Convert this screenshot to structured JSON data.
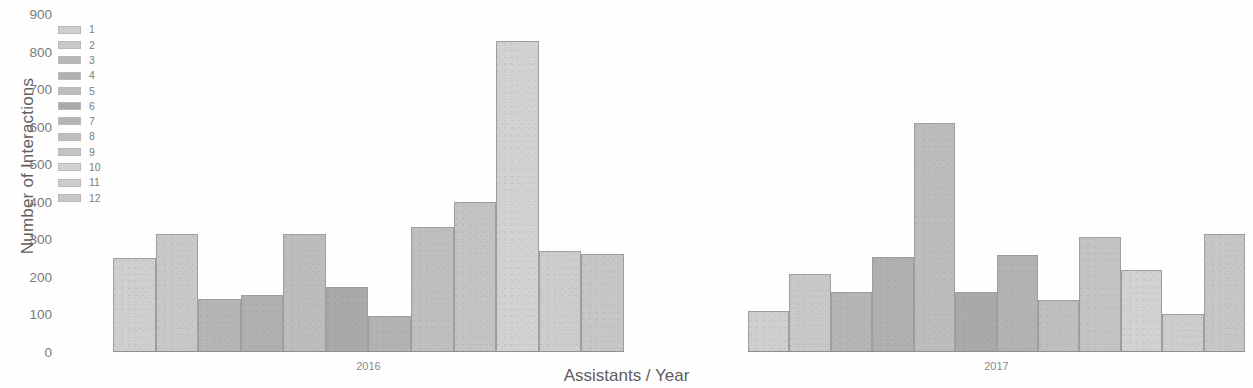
{
  "chart_data": {
    "type": "bar",
    "title": "",
    "xlabel": "Assistants / Year",
    "ylabel": "Number of Interactions",
    "ylim": [
      0,
      900
    ],
    "ytick_labels": [
      "900",
      "800",
      "700",
      "600",
      "500",
      "400",
      "300",
      "200",
      "100",
      "0"
    ],
    "ytick_values": [
      900,
      800,
      700,
      600,
      500,
      400,
      300,
      200,
      100,
      0
    ],
    "grid": false,
    "legend_position": "upper-left",
    "legend_title": "",
    "categories": [
      "2016",
      "2017"
    ],
    "series": [
      {
        "name": "1",
        "color": "#cfcfcf",
        "values": [
          250,
          110
        ]
      },
      {
        "name": "2",
        "color": "#c9c9c9",
        "values": [
          315,
          207
        ]
      },
      {
        "name": "3",
        "color": "#b6b6b6",
        "values": [
          140,
          160
        ]
      },
      {
        "name": "4",
        "color": "#b0b0b0",
        "values": [
          152,
          253
        ]
      },
      {
        "name": "5",
        "color": "#bdbdbd",
        "values": [
          315,
          610
        ]
      },
      {
        "name": "6",
        "color": "#aaaaaa",
        "values": [
          172,
          160
        ]
      },
      {
        "name": "7",
        "color": "#b3b3b3",
        "values": [
          95,
          258
        ]
      },
      {
        "name": "8",
        "color": "#bfbfbf",
        "values": [
          333,
          138
        ]
      },
      {
        "name": "9",
        "color": "#c4c4c4",
        "values": [
          400,
          305
        ]
      },
      {
        "name": "10",
        "color": "#d2d2d2",
        "values": [
          828,
          218
        ]
      },
      {
        "name": "11",
        "color": "#cdcdcd",
        "values": [
          270,
          101
        ]
      },
      {
        "name": "12",
        "color": "#c7c7c7",
        "values": [
          260,
          313
        ]
      }
    ],
    "groups": [
      {
        "label": "2016",
        "bars": [
          {
            "series": "1",
            "value": 250,
            "color": "#cfcfcf"
          },
          {
            "series": "2",
            "value": 315,
            "color": "#c9c9c9"
          },
          {
            "series": "3",
            "value": 140,
            "color": "#b6b6b6"
          },
          {
            "series": "4",
            "value": 152,
            "color": "#b0b0b0"
          },
          {
            "series": "5",
            "value": 315,
            "color": "#bdbdbd"
          },
          {
            "series": "6",
            "value": 172,
            "color": "#aaaaaa"
          },
          {
            "series": "7",
            "value": 95,
            "color": "#b3b3b3"
          },
          {
            "series": "8",
            "value": 333,
            "color": "#bfbfbf"
          },
          {
            "series": "9",
            "value": 400,
            "color": "#c4c4c4"
          },
          {
            "series": "10",
            "value": 828,
            "color": "#d2d2d2"
          },
          {
            "series": "11",
            "value": 270,
            "color": "#cdcdcd"
          },
          {
            "series": "12",
            "value": 260,
            "color": "#c7c7c7"
          }
        ]
      },
      {
        "label": "2017",
        "bars": [
          {
            "series": "1",
            "value": 110,
            "color": "#cfcfcf"
          },
          {
            "series": "2",
            "value": 207,
            "color": "#c9c9c9"
          },
          {
            "series": "3",
            "value": 160,
            "color": "#b6b6b6"
          },
          {
            "series": "4",
            "value": 253,
            "color": "#b0b0b0"
          },
          {
            "series": "5",
            "value": 610,
            "color": "#bdbdbd"
          },
          {
            "series": "6",
            "value": 160,
            "color": "#aaaaaa"
          },
          {
            "series": "7",
            "value": 258,
            "color": "#b3b3b3"
          },
          {
            "series": "8",
            "value": 138,
            "color": "#bfbfbf"
          },
          {
            "series": "9",
            "value": 305,
            "color": "#c4c4c4"
          },
          {
            "series": "10",
            "value": 218,
            "color": "#d2d2d2"
          },
          {
            "series": "11",
            "value": 101,
            "color": "#cdcdcd"
          },
          {
            "series": "12",
            "value": 313,
            "color": "#c7c7c7"
          }
        ]
      }
    ]
  },
  "legend": {
    "items": [
      {
        "label": "1",
        "color": "#cfcfcf"
      },
      {
        "label": "2",
        "color": "#c9c9c9"
      },
      {
        "label": "3",
        "color": "#b6b6b6"
      },
      {
        "label": "4",
        "color": "#b0b0b0"
      },
      {
        "label": "5",
        "color": "#bdbdbd"
      },
      {
        "label": "6",
        "color": "#aaaaaa"
      },
      {
        "label": "7",
        "color": "#b3b3b3"
      },
      {
        "label": "8",
        "color": "#bfbfbf"
      },
      {
        "label": "9",
        "color": "#c4c4c4"
      },
      {
        "label": "10",
        "color": "#d2d2d2"
      },
      {
        "label": "11",
        "color": "#cdcdcd"
      },
      {
        "label": "12",
        "color": "#c7c7c7"
      }
    ]
  },
  "layout": {
    "group_geometry": [
      {
        "left_px": 113,
        "width_px": 511
      },
      {
        "left_px": 748,
        "width_px": 497
      }
    ],
    "plot_bottom_px": 36,
    "plot_height_px": 338
  }
}
